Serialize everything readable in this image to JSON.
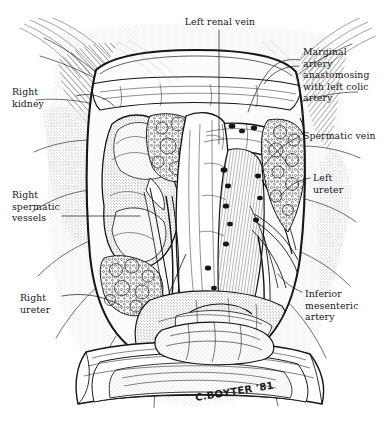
{
  "page": {
    "running_header": "",
    "folio": "",
    "width": 389,
    "height": 423,
    "background": "#ffffff",
    "ink": "#15151a"
  },
  "illustration": {
    "kind": "pen-and-ink medical illustration",
    "subject": "Retroperitoneal surgical exposure of the right kidney, great vessels and ureters",
    "signature": "C.BOYTER '81"
  },
  "labels": {
    "top": {
      "id": "left-renal-vein",
      "text": "Left renal vein",
      "x": 168,
      "y": 16
    },
    "right": [
      {
        "id": "marginal-artery",
        "text": "Marginal\nartery\nanastomosing\nwith left colic\nartery",
        "x": 303,
        "y": 46
      },
      {
        "id": "spermatic-vein",
        "text": "Spermatic vein",
        "x": 303,
        "y": 130
      },
      {
        "id": "left-ureter",
        "text": "Left\nureter",
        "x": 313,
        "y": 172
      },
      {
        "id": "inferior-mesenteric-artery",
        "text": "Inferior\nmesenteric\nartery",
        "x": 305,
        "y": 288
      }
    ],
    "left": [
      {
        "id": "right-kidney",
        "text": "Right\nkidney",
        "x": 12,
        "y": 86
      },
      {
        "id": "right-spermatic-vessels",
        "text": "Right\nspermatic\nvessels",
        "x": 12,
        "y": 189
      },
      {
        "id": "right-ureter",
        "text": "Right\nureter",
        "x": 20,
        "y": 292
      }
    ]
  }
}
